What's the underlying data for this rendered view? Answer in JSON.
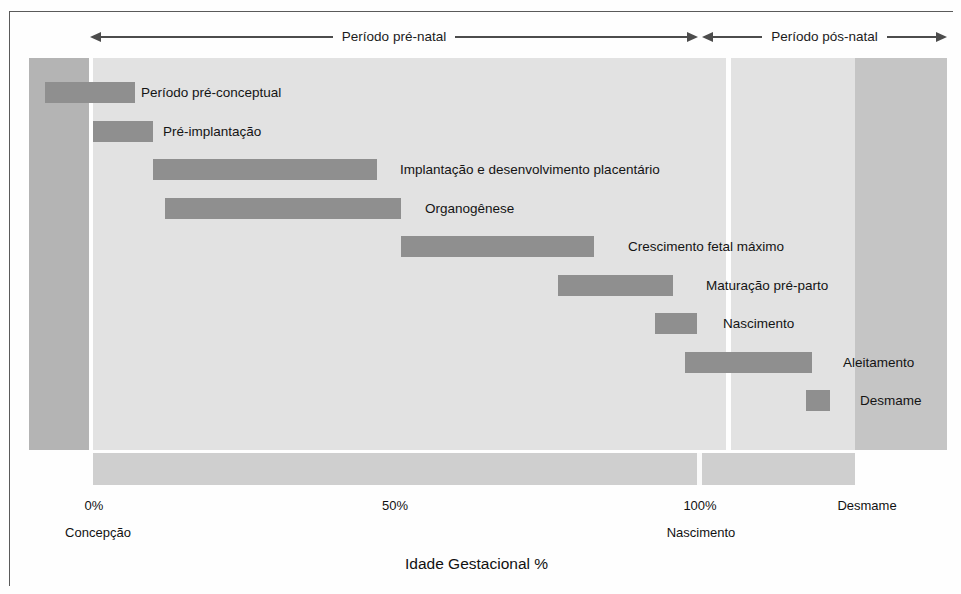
{
  "figure": {
    "axis_title": "Idade Gestacional %",
    "periods": [
      {
        "label": "Período pré-natal"
      },
      {
        "label": "Período pós-natal"
      }
    ],
    "ticks": [
      {
        "label": "0%",
        "sub": "Concepção"
      },
      {
        "label": "50%",
        "sub": ""
      },
      {
        "label": "100%",
        "sub": "Nascimento"
      },
      {
        "label": "Desmame",
        "sub": ""
      }
    ],
    "colors": {
      "bar": "#8f8f8f",
      "band_pre_conception": "#b4b4b4",
      "band_gestation": "#e2e2e2",
      "band_lactation": "#e2e2e2",
      "band_post_weaning": "#c5c5c5",
      "axis_strip": "#cfcfcf",
      "frame": "#5a5a5a",
      "text": "#141414"
    }
  },
  "chart_data": {
    "type": "bar",
    "title": "",
    "subtitle": "",
    "xlabel": "Idade Gestacional %",
    "ylabel": "",
    "orientation": "horizontal",
    "grid": false,
    "legend": "none",
    "xlim": [
      -12,
      130
    ],
    "xticks": [
      0,
      50,
      100,
      120
    ],
    "xticklabels": [
      "0%",
      "50%",
      "100%",
      "Desmame"
    ],
    "xtick_sublabels": [
      "Concepção",
      "",
      "Nascimento",
      ""
    ],
    "x_unit": "percent of gestational age",
    "annotations": [
      {
        "text": "Período pré-natal",
        "from": 0,
        "to": 100
      },
      {
        "text": "Período pós-natal",
        "from": 100,
        "to": 130
      }
    ],
    "categories": [
      "Período pré-conceptual",
      "Pré-implantação",
      "Implantação e desenvolvimento placentário",
      "Organogênese",
      "Crescimento fetal máximo",
      "Maturação pré-parto",
      "Nascimento",
      "Aleitamento",
      "Desmame"
    ],
    "bars": [
      {
        "label": "Período pré-conceptual",
        "start": -8,
        "end": 7,
        "label_x": 141
      },
      {
        "label": "Pré-implantação",
        "start": 0,
        "end": 10,
        "label_x": 163
      },
      {
        "label": "Implantação e desenvolvimento placentário",
        "start": 10,
        "end": 47,
        "label_x": 400
      },
      {
        "label": "Organogênese",
        "start": 12,
        "end": 51,
        "label_x": 425
      },
      {
        "label": "Crescimento fetal máximo",
        "start": 51,
        "end": 83,
        "label_x": 628
      },
      {
        "label": "Maturação pré-parto",
        "start": 77,
        "end": 96,
        "label_x": 706
      },
      {
        "label": "Nascimento",
        "start": 93,
        "end": 100,
        "label_x": 723
      },
      {
        "label": "Aleitamento",
        "start": 98,
        "end": 119,
        "label_x": 843
      },
      {
        "label": "Desmame",
        "start": 118,
        "end": 122,
        "label_x": 860
      }
    ]
  }
}
